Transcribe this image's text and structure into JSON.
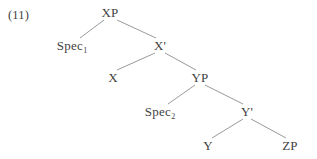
{
  "figure": {
    "example_number": "(11)",
    "type": "syntax-tree",
    "line_color": "#8d8d8d",
    "text_color": "#3f3f3f",
    "background_color": "#ffffff"
  },
  "nodes": [
    {
      "id": "xp",
      "label": "XP",
      "sub": "",
      "x": 110,
      "y": 12
    },
    {
      "id": "spec1",
      "label": "Spec",
      "sub": "1",
      "x": 72,
      "y": 45
    },
    {
      "id": "xbar",
      "label": "X'",
      "sub": "",
      "x": 160,
      "y": 45
    },
    {
      "id": "x",
      "label": "X",
      "sub": "",
      "x": 113,
      "y": 77
    },
    {
      "id": "yp",
      "label": "YP",
      "sub": "",
      "x": 200,
      "y": 77
    },
    {
      "id": "spec2",
      "label": "Spec",
      "sub": "2",
      "x": 160,
      "y": 111
    },
    {
      "id": "ybar",
      "label": "Y'",
      "sub": "",
      "x": 247,
      "y": 111
    },
    {
      "id": "y",
      "label": "Y",
      "sub": "",
      "x": 208,
      "y": 145
    },
    {
      "id": "zp",
      "label": "ZP",
      "sub": "",
      "x": 290,
      "y": 145
    }
  ],
  "edges": [
    {
      "from": "xp",
      "to": "spec1",
      "x1": 104,
      "y1": 20,
      "x2": 80,
      "y2": 38
    },
    {
      "from": "xp",
      "to": "xbar",
      "x1": 117,
      "y1": 20,
      "x2": 156,
      "y2": 38
    },
    {
      "from": "xbar",
      "to": "x",
      "x1": 155,
      "y1": 53,
      "x2": 117,
      "y2": 70
    },
    {
      "from": "xbar",
      "to": "yp",
      "x1": 165,
      "y1": 53,
      "x2": 196,
      "y2": 70
    },
    {
      "from": "yp",
      "to": "spec2",
      "x1": 195,
      "y1": 85,
      "x2": 168,
      "y2": 104
    },
    {
      "from": "yp",
      "to": "ybar",
      "x1": 205,
      "y1": 85,
      "x2": 243,
      "y2": 104
    },
    {
      "from": "ybar",
      "to": "y",
      "x1": 243,
      "y1": 119,
      "x2": 212,
      "y2": 138
    },
    {
      "from": "ybar",
      "to": "zp",
      "x1": 251,
      "y1": 119,
      "x2": 286,
      "y2": 138
    }
  ]
}
